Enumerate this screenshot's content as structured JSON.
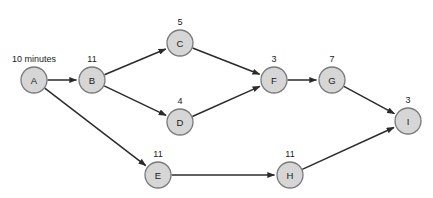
{
  "diagram": {
    "type": "activity-on-node-network",
    "units_label": "10 minutes",
    "nodes": [
      {
        "id": "A",
        "label": "A",
        "duration": "10 minutes",
        "duration_shown": "10 minutes",
        "x": 34,
        "y": 80
      },
      {
        "id": "B",
        "label": "B",
        "duration": "11",
        "x": 92,
        "y": 80
      },
      {
        "id": "C",
        "label": "C",
        "duration": "5",
        "x": 180,
        "y": 43
      },
      {
        "id": "D",
        "label": "D",
        "duration": "4",
        "x": 180,
        "y": 122
      },
      {
        "id": "E",
        "label": "E",
        "duration": "11",
        "x": 158,
        "y": 175
      },
      {
        "id": "F",
        "label": "F",
        "duration": "3",
        "x": 274,
        "y": 80
      },
      {
        "id": "G",
        "label": "G",
        "duration": "7",
        "x": 332,
        "y": 80
      },
      {
        "id": "H",
        "label": "H",
        "duration": "11",
        "x": 290,
        "y": 175
      },
      {
        "id": "I",
        "label": "I",
        "duration": "3",
        "x": 408,
        "y": 121
      }
    ],
    "edges": [
      {
        "from": "A",
        "to": "B"
      },
      {
        "from": "A",
        "to": "E"
      },
      {
        "from": "B",
        "to": "C"
      },
      {
        "from": "B",
        "to": "D"
      },
      {
        "from": "C",
        "to": "F"
      },
      {
        "from": "D",
        "to": "F"
      },
      {
        "from": "F",
        "to": "G"
      },
      {
        "from": "G",
        "to": "I"
      },
      {
        "from": "E",
        "to": "H"
      },
      {
        "from": "H",
        "to": "I"
      }
    ],
    "colors": {
      "node_fill": "#d6d6d6",
      "node_stroke": "#7a7a7a",
      "edge_stroke": "#2b2b2b",
      "text": "#1a1a1a",
      "background": "#ffffff"
    },
    "node_radius": 13
  }
}
